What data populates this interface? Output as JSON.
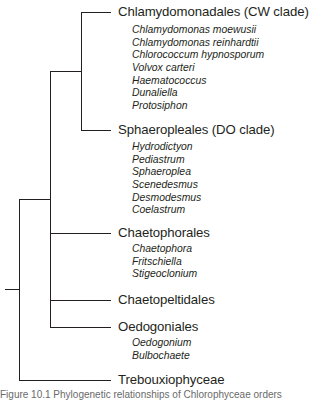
{
  "diagram": {
    "type": "phylogenetic-tree",
    "clades": [
      {
        "name": "Chlamydomonadales (CW clade)",
        "species": [
          "Chlamydomonas moewusii",
          "Chlamydomonas reinhardtii",
          "Chlorococcum hypnosporum",
          "Volvox carteri",
          "Haematococcus",
          "Dunaliella",
          "Protosiphon"
        ]
      },
      {
        "name": "Sphaeropleales (DO clade)",
        "species": [
          "Hydrodictyon",
          "Pediastrum",
          "Sphaeroplea",
          "Scenedesmus",
          "Desmodesmus",
          "Coelastrum"
        ]
      },
      {
        "name": "Chaetophorales",
        "species": [
          "Chaetophora",
          "Fritschiella",
          "Stigeoclonium"
        ]
      },
      {
        "name": "Chaetopeltidales",
        "species": []
      },
      {
        "name": "Oedogoniales",
        "species": [
          "Oedogonium",
          "Bulbochaete"
        ]
      },
      {
        "name": "Trebouxiophyceae",
        "species": []
      }
    ],
    "caption": "Figure 10.1  Phylogenetic relationships of Chlorophyceae orders"
  }
}
